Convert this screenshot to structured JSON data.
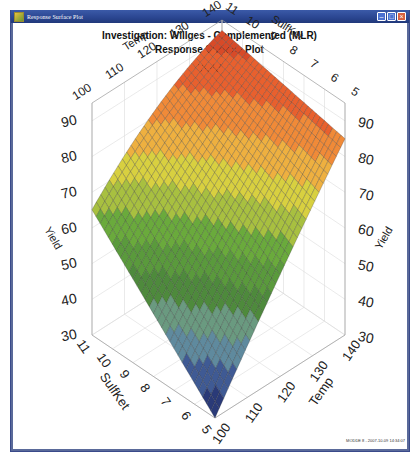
{
  "window": {
    "title": "Response Surface Plot",
    "controls": [
      "minimize",
      "maximize",
      "close"
    ]
  },
  "footer": "MODDE 8 - 2007-10-09 14:34:07",
  "chart_data": {
    "type": "surface3d",
    "title": "Investigation: Willges - Complemented (MLR)",
    "subtitle": "Response Surface Plot",
    "response": "Yield",
    "axes": {
      "x": {
        "label": "Temp",
        "ticks": [
          100,
          110,
          120,
          130,
          140
        ],
        "range": [
          100,
          140
        ]
      },
      "y": {
        "label": "SulfKet",
        "ticks": [
          5,
          6,
          7,
          8,
          9,
          10,
          11
        ],
        "range": [
          5,
          11
        ]
      },
      "z": {
        "label": "Yield",
        "ticks": [
          30,
          40,
          50,
          60,
          70,
          80,
          90
        ],
        "range": [
          30,
          95
        ]
      }
    },
    "corner_values": {
      "temp100_sulf5": 30,
      "temp140_sulf11": 93,
      "temp100_sulf11": 70,
      "temp140_sulf5": 85
    },
    "contour_levels": [
      30,
      35,
      40,
      45,
      50,
      55,
      60,
      65,
      70,
      75,
      80,
      85,
      90,
      95
    ],
    "colormap": [
      "#2a3a78",
      "#3f5a94",
      "#5f8a9e",
      "#6a9a80",
      "#4e8a3c",
      "#5a9a3c",
      "#6aaa3c",
      "#a8c040",
      "#d8d040",
      "#eeb040",
      "#f08a38",
      "#e8602e",
      "#d84a28",
      "#c83a20"
    ]
  }
}
